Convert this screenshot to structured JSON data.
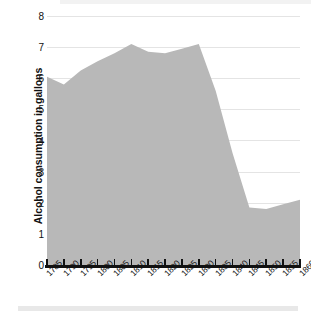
{
  "chart_data": {
    "type": "area",
    "title": "",
    "xlabel": "",
    "ylabel": "Alcohol consumption in gallons",
    "x": [
      1785,
      1790,
      1795,
      1800,
      1805,
      1810,
      1815,
      1820,
      1825,
      1830,
      1835,
      1840,
      1845,
      1850,
      1855,
      1860
    ],
    "categories": [
      "1785",
      "1790",
      "1795",
      "1800",
      "1805",
      "1810",
      "1815",
      "1820",
      "1825",
      "1830",
      "1835",
      "1840",
      "1845",
      "1850",
      "1855",
      "1860"
    ],
    "values": [
      6.05,
      5.8,
      6.25,
      6.55,
      6.8,
      7.1,
      6.85,
      6.8,
      6.95,
      7.1,
      5.6,
      3.6,
      1.85,
      1.8,
      1.95,
      2.1
    ],
    "series": [
      {
        "name": "Alcohol consumption",
        "values": [
          6.05,
          5.8,
          6.25,
          6.55,
          6.8,
          7.1,
          6.85,
          6.8,
          6.95,
          7.1,
          5.6,
          3.6,
          1.85,
          1.8,
          1.95,
          2.1
        ]
      }
    ],
    "ylim": [
      0,
      8
    ],
    "xlim": [
      1785,
      1860
    ],
    "yticks": [
      0,
      1,
      2,
      3,
      4,
      5,
      6,
      7,
      8
    ],
    "ytick_labels": [
      "0",
      "1",
      "2",
      "3",
      "4",
      "5",
      "6",
      "7",
      "8"
    ],
    "grid": true,
    "legend": false,
    "legend_position": "none",
    "colors": {
      "area_fill": "#b8b8b8",
      "gridline": "#e4e4e4",
      "axis": "#111111",
      "text": "#111111",
      "background": "#ffffff",
      "band": "#ebebeb"
    }
  }
}
